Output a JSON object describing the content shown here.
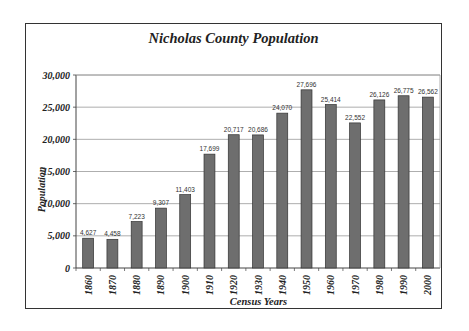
{
  "chart_data": {
    "type": "bar",
    "title": "Nicholas County Population",
    "xlabel": "Census Years",
    "ylabel": "Population",
    "categories": [
      "1860",
      "1870",
      "1880",
      "1890",
      "1900",
      "1910",
      "1920",
      "1930",
      "1940",
      "1950",
      "1960",
      "1970",
      "1980",
      "1990",
      "2000"
    ],
    "values": [
      4627,
      4458,
      7223,
      9307,
      11403,
      17699,
      20717,
      20686,
      24070,
      27696,
      25414,
      22552,
      26126,
      26775,
      26562
    ],
    "data_labels": [
      "4,627",
      "4,458",
      "7,223",
      "9,307",
      "11,403",
      "17,699",
      "20,717",
      "20,686",
      "24,070",
      "27,696",
      "25,414",
      "22,552",
      "26,126",
      "26,775",
      "26,562"
    ],
    "ylim": [
      0,
      30000
    ],
    "yticks": [
      0,
      5000,
      10000,
      15000,
      20000,
      25000,
      30000
    ],
    "ytick_labels": [
      "0",
      "5,000",
      "10,000",
      "15,000",
      "20,000",
      "25,000",
      "30,000"
    ],
    "grid": true,
    "legend": null,
    "bar_color": "#6e6e6e"
  }
}
